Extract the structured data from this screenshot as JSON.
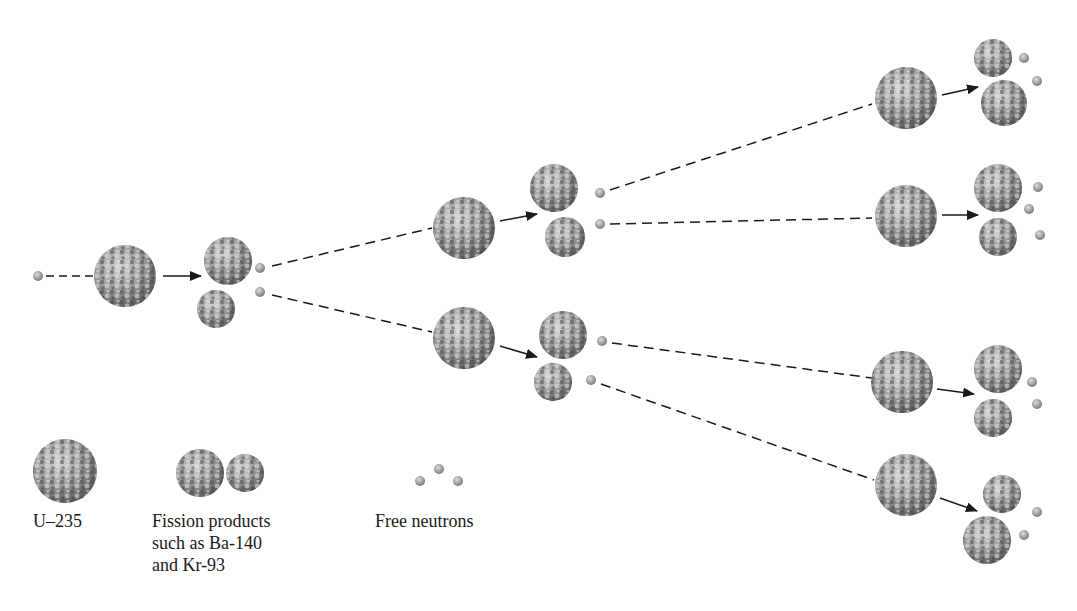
{
  "legend": {
    "u235": "U–235",
    "fission_line1": "Fission products",
    "fission_line2": "such as Ba-140",
    "fission_line3": "and Kr-93",
    "neutrons": "Free neutrons"
  },
  "colors": {
    "nucleus_light": "#bdbdbd",
    "nucleus_dark": "#4a4a4a",
    "neutron": "#9a9a9a",
    "line": "#1a1a1a"
  },
  "stages": [
    {
      "name": "incoming neutron",
      "count": 1
    },
    {
      "name": "U-235 nucleus",
      "count": 1
    },
    {
      "name": "fission products + 2 neutrons",
      "count": 1
    },
    {
      "name": "U-235 nuclei",
      "count": 2
    },
    {
      "name": "fission products + neutrons",
      "count": 2
    },
    {
      "name": "U-235 nuclei",
      "count": 4
    },
    {
      "name": "fission products + neutrons",
      "count": 4
    }
  ]
}
